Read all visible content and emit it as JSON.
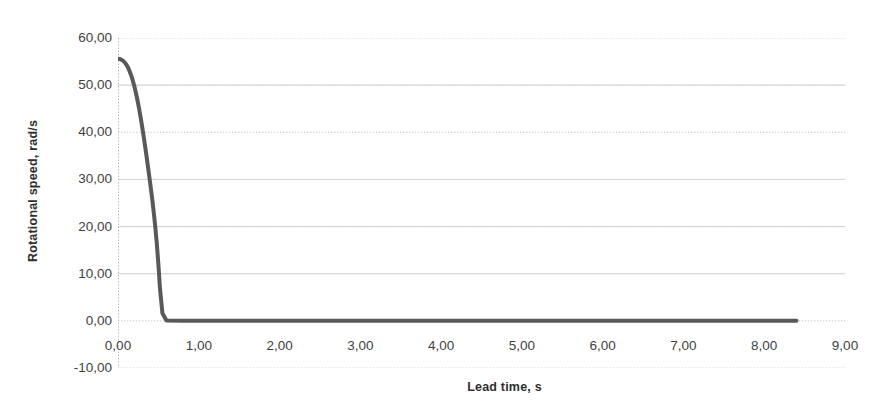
{
  "chart_data": {
    "type": "line",
    "title": "",
    "xlabel": "Lead time, s",
    "ylabel": "Rotational speed, rad/s",
    "xlim": [
      0,
      9
    ],
    "ylim": [
      -10,
      60
    ],
    "xtick_labels": [
      "0,00",
      "1,00",
      "2,00",
      "3,00",
      "4,00",
      "5,00",
      "6,00",
      "7,00",
      "8,00",
      "9,00"
    ],
    "xtick_values": [
      0,
      1,
      2,
      3,
      4,
      5,
      6,
      7,
      8,
      9
    ],
    "ytick_labels": [
      "60,00",
      "50,00",
      "40,00",
      "30,00",
      "20,00",
      "10,00",
      "0,00",
      "-10,00"
    ],
    "ytick_values": [
      60,
      50,
      40,
      30,
      20,
      10,
      0,
      -10
    ],
    "grid": true,
    "grid_color": "#c9c9c9",
    "legend": "none",
    "decimal_separator": ",",
    "series": [
      {
        "name": "Rotational speed",
        "color": "#595959",
        "line_width": 4,
        "x": [
          0.0,
          0.02,
          0.04,
          0.06,
          0.08,
          0.1,
          0.12,
          0.14,
          0.16,
          0.18,
          0.2,
          0.22,
          0.24,
          0.26,
          0.28,
          0.3,
          0.32,
          0.34,
          0.36,
          0.38,
          0.4,
          0.42,
          0.44,
          0.46,
          0.48,
          0.5,
          0.52,
          0.55,
          0.6,
          0.8,
          1.0,
          1.5,
          2.0,
          2.5,
          3.0,
          3.5,
          4.0,
          4.5,
          5.0,
          5.5,
          6.0,
          6.5,
          7.0,
          7.5,
          8.0,
          8.4
        ],
        "y": [
          55.6,
          55.55,
          55.42,
          55.2,
          54.88,
          54.44,
          53.86,
          53.12,
          52.22,
          51.16,
          49.92,
          48.5,
          46.9,
          45.12,
          43.18,
          41.1,
          38.88,
          36.54,
          34.1,
          31.58,
          29.0,
          26.3,
          23.4,
          20.2,
          16.5,
          12.0,
          6.8,
          1.6,
          0.1,
          0.0,
          0.0,
          0.0,
          0.0,
          0.0,
          0.0,
          0.0,
          0.0,
          0.0,
          0.0,
          0.0,
          0.0,
          0.0,
          0.0,
          0.0,
          0.0,
          0.0
        ]
      }
    ]
  }
}
